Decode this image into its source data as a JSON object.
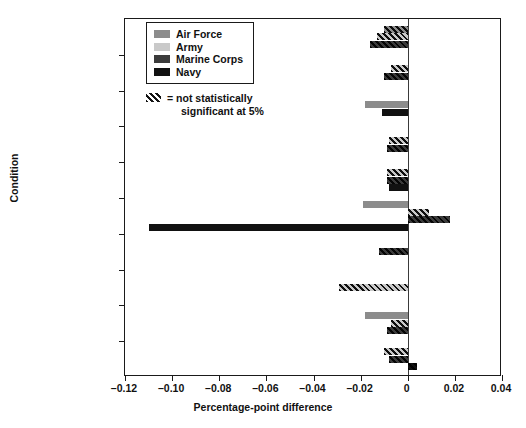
{
  "chart_data": {
    "type": "bar",
    "orientation": "horizontal",
    "title": "",
    "xlabel": "Percentage-point difference",
    "ylabel": "Condition",
    "xlim": [
      -0.12,
      0.04
    ],
    "xticks": [
      -0.12,
      -0.1,
      -0.08,
      -0.06,
      -0.04,
      -0.02,
      0,
      0.02,
      0.04
    ],
    "xticklabels": [
      "–0.12",
      "–0.10",
      "–0.08",
      "–0.06",
      "–0.04",
      "–0.02",
      "0",
      "0.02",
      "0.04"
    ],
    "grid": false,
    "legend_position": "upper-left-inside",
    "categories": [
      "Abdominal: loosened 2004",
      "Asthma: tightened 2004",
      "Abdominal: tightened 2005",
      "Knee: tightened 2005",
      "Hearing: tightened 2005",
      "Skin and cellular: tightened 2005",
      "Endocrine: tightened 2005",
      "Skin and cellular: tightened 2010",
      "Elbow: loosened 2010",
      "Orthotics: loosened 2010"
    ],
    "category_lines": [
      [
        "Abdominal:",
        "loosened 2004"
      ],
      [
        "Asthma:",
        "tightened 2004"
      ],
      [
        "Abdominal:",
        "tightened 2005"
      ],
      [
        "Knee:",
        "tightened 2005"
      ],
      [
        "Hearing:",
        "tightened 2005"
      ],
      [
        "Skin and cellular:",
        "tightened 2005"
      ],
      [
        "Endocrine:",
        "tightened 2005"
      ],
      [
        "Skin and cellular:",
        "tightened 2010"
      ],
      [
        "Elbow:",
        "loosened 2010"
      ],
      [
        "Orthotics:",
        "loosened 2010"
      ]
    ],
    "series": [
      {
        "name": "Air Force",
        "color": "#8c8c8c",
        "values": [
          -0.01,
          null,
          -0.018,
          null,
          null,
          -0.019,
          null,
          null,
          -0.018,
          null
        ],
        "not_significant": [
          true,
          null,
          false,
          null,
          null,
          false,
          null,
          null,
          false,
          null
        ]
      },
      {
        "name": "Army",
        "color": "#c9c9c9",
        "values": [
          -0.013,
          -0.007,
          null,
          -0.008,
          -0.009,
          0.009,
          null,
          -0.029,
          -0.007,
          -0.01
        ],
        "not_significant": [
          true,
          true,
          null,
          true,
          true,
          true,
          null,
          true,
          true,
          true
        ]
      },
      {
        "name": "Marine Corps",
        "color": "#3b3b3b",
        "values": [
          -0.016,
          -0.01,
          null,
          -0.009,
          -0.009,
          0.018,
          -0.012,
          null,
          -0.009,
          -0.008
        ],
        "not_significant": [
          true,
          true,
          null,
          true,
          true,
          true,
          true,
          null,
          true,
          true
        ]
      },
      {
        "name": "Navy",
        "color": "#111111",
        "values": [
          null,
          null,
          -0.011,
          null,
          -0.008,
          -0.11,
          null,
          null,
          null,
          0.004
        ],
        "not_significant": [
          null,
          null,
          false,
          null,
          false,
          false,
          null,
          null,
          null,
          true
        ]
      }
    ]
  },
  "legend": {
    "items": [
      {
        "label": "Air Force",
        "color": "#8c8c8c",
        "hatched": false
      },
      {
        "label": "Army",
        "color": "#c9c9c9",
        "hatched": false
      },
      {
        "label": "Marine Corps",
        "color": "#3b3b3b",
        "hatched": false
      },
      {
        "label": "Navy",
        "color": "#111111",
        "hatched": false
      }
    ],
    "note_line1": "= not statistically",
    "note_line2": "significant at 5%"
  }
}
